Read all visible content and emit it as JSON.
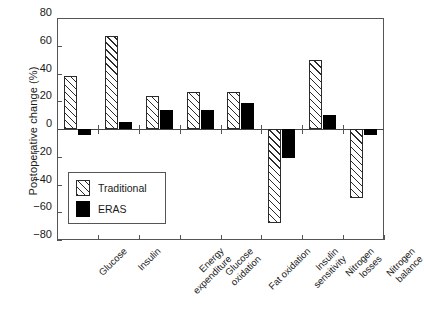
{
  "chart_data": {
    "type": "bar",
    "title": "",
    "xlabel": "",
    "ylabel": "Postoperative change (%)",
    "ylim": [
      -80,
      80
    ],
    "yticks": [
      80,
      60,
      40,
      20,
      0,
      -20,
      -40,
      -60,
      -80
    ],
    "ytick_labels": [
      "80",
      "60",
      "40",
      "20",
      "0",
      "−20",
      "−40",
      "−60",
      "−80"
    ],
    "grid": false,
    "legend_position": "lower-left-inside",
    "categories": [
      "Glucose",
      "Insulin",
      "Energy expenditure",
      "Glucose oxidation",
      "Fat oxidation",
      "Insulin sensitivity",
      "Nitrogen losses",
      "Nitrogen balance"
    ],
    "category_lines": [
      [
        "Glucose"
      ],
      [
        "Insulin"
      ],
      [
        "Energy",
        "expenditure"
      ],
      [
        "Glucose",
        "oxidation"
      ],
      [
        "Fat oxidation"
      ],
      [
        "Insulin",
        "sensitivity"
      ],
      [
        "Nitrogen",
        "losses"
      ],
      [
        "Nitrogen",
        "balance"
      ]
    ],
    "series": [
      {
        "name": "Traditional",
        "color": "#ffffff",
        "pattern": "diagonal-hatch",
        "values": [
          38,
          67,
          24,
          27,
          27,
          -68,
          50,
          -50
        ]
      },
      {
        "name": "ERAS",
        "color": "#000000",
        "pattern": "solid",
        "values": [
          -4,
          5,
          14,
          14,
          19,
          -21,
          10,
          -4
        ]
      }
    ]
  },
  "legend": {
    "entries": [
      {
        "label": "Traditional"
      },
      {
        "label": "ERAS"
      }
    ]
  }
}
